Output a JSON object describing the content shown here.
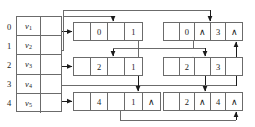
{
  "diagram": {
    "stroke_color": "#6b6b6b",
    "text_color": "#1b1b1b"
  },
  "vertex_table": {
    "name": "vertex-table",
    "rows": [
      {
        "index": "0",
        "vertex": "v",
        "sub": "1"
      },
      {
        "index": "1",
        "vertex": "v",
        "sub": "2"
      },
      {
        "index": "2",
        "vertex": "v",
        "sub": "3"
      },
      {
        "index": "3",
        "vertex": "v",
        "sub": "4"
      },
      {
        "index": "4",
        "vertex": "v",
        "sub": "5"
      }
    ]
  },
  "middle_nodes": [
    {
      "id": "mid-node-1",
      "cells": [
        "",
        "0",
        "",
        "1"
      ]
    },
    {
      "id": "mid-node-2",
      "cells": [
        "",
        "2",
        "",
        "1"
      ]
    },
    {
      "id": "mid-node-3",
      "cells": [
        "",
        "4",
        "",
        "1"
      ]
    }
  ],
  "right_nodes": [
    {
      "id": "right-node-1",
      "cells": [
        "",
        "0",
        "∧",
        "3",
        "∧"
      ]
    },
    {
      "id": "right-node-2",
      "cells": [
        "",
        "2",
        "",
        "3",
        ""
      ]
    },
    {
      "id": "right-node-3",
      "cells": [
        "",
        "2",
        "∧",
        "4",
        "∧"
      ]
    }
  ],
  "middle_node_tail_marks": [
    "",
    "",
    "∧"
  ]
}
